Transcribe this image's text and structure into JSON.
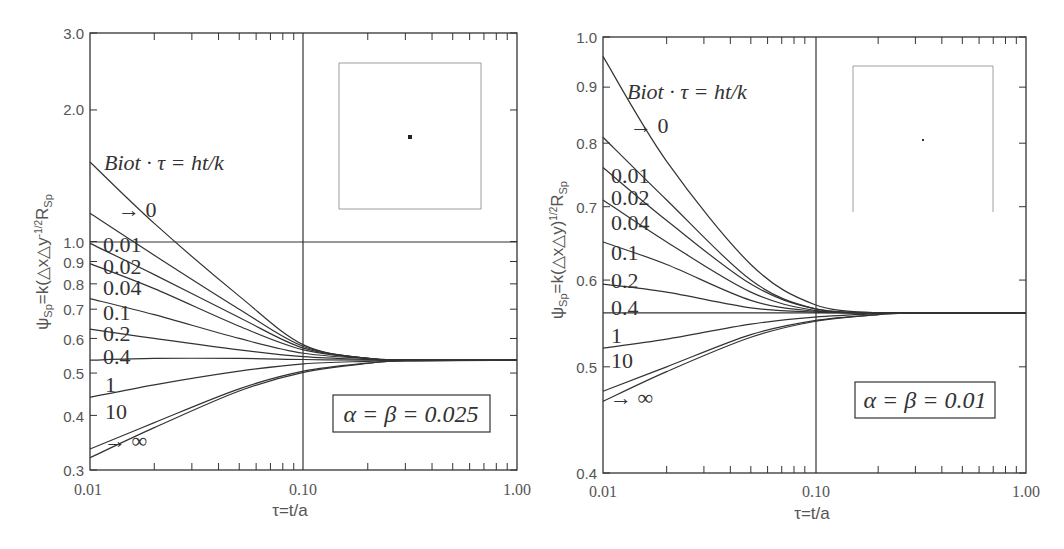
{
  "chart_data": [
    {
      "type": "line",
      "panel": "left",
      "title": "",
      "xlabel": "τ=t/a",
      "ylabel": "ψSp=k(△x△y)^-1/2 RSp",
      "xscale": "log",
      "yscale": "log",
      "xlim": [
        0.01,
        1.0
      ],
      "ylim": [
        0.3,
        3.0
      ],
      "x_ticks": [
        "0.01",
        "0.10",
        "1.00"
      ],
      "y_ticks": [
        "0.3",
        "0.4",
        "0.5",
        "0.6",
        "0.7",
        "0.8",
        "0.9",
        "1.0",
        "2.0",
        "3.0"
      ],
      "annotation": "Biot·τ = ht/k",
      "box_label": "α = β = 0.025",
      "grid": false,
      "reference_lines": {
        "x": 0.1,
        "y": 1.0
      },
      "x": [
        0.01,
        0.02,
        0.05,
        0.1,
        0.2,
        0.3,
        1.0
      ],
      "series": [
        {
          "name": "→ 0",
          "values": [
            1.52,
            1.1,
            0.75,
            0.58,
            0.54,
            0.535,
            0.535
          ]
        },
        {
          "name": "0.01",
          "values": [
            1.16,
            0.93,
            0.7,
            0.575,
            0.54,
            0.535,
            0.535
          ]
        },
        {
          "name": "0.02",
          "values": [
            0.99,
            0.84,
            0.67,
            0.57,
            0.54,
            0.535,
            0.535
          ]
        },
        {
          "name": "0.04",
          "values": [
            0.89,
            0.78,
            0.64,
            0.565,
            0.54,
            0.535,
            0.535
          ]
        },
        {
          "name": "0.1",
          "values": [
            0.74,
            0.68,
            0.6,
            0.555,
            0.54,
            0.535,
            0.535
          ]
        },
        {
          "name": "0.2",
          "values": [
            0.63,
            0.6,
            0.565,
            0.545,
            0.537,
            0.535,
            0.535
          ]
        },
        {
          "name": "0.4",
          "values": [
            0.535,
            0.54,
            0.54,
            0.537,
            0.535,
            0.535,
            0.535
          ]
        },
        {
          "name": "1",
          "values": [
            0.44,
            0.47,
            0.505,
            0.525,
            0.532,
            0.535,
            0.535
          ]
        },
        {
          "name": "10",
          "values": [
            0.335,
            0.385,
            0.46,
            0.505,
            0.527,
            0.533,
            0.535
          ]
        },
        {
          "name": "→ ∞",
          "values": [
            0.32,
            0.375,
            0.455,
            0.502,
            0.526,
            0.533,
            0.535
          ]
        }
      ]
    },
    {
      "type": "line",
      "panel": "right",
      "title": "",
      "xlabel": "τ=t/a",
      "ylabel": "ψSp=k(△x△y)^-1/2 RSp",
      "xscale": "log",
      "yscale": "log",
      "xlim": [
        0.01,
        1.0
      ],
      "ylim": [
        0.4,
        1.0
      ],
      "x_ticks": [
        "0.01",
        "0.10",
        "1.00"
      ],
      "y_ticks": [
        "0.4",
        "0.5",
        "0.6",
        "0.7",
        "0.8",
        "0.9",
        "1.0"
      ],
      "annotation": "Biot·τ = ht/k",
      "box_label": "α = β = 0.01",
      "grid": false,
      "reference_lines": {
        "x": 0.1
      },
      "x": [
        0.01,
        0.02,
        0.05,
        0.1,
        0.2,
        0.3,
        1.0
      ],
      "series": [
        {
          "name": "→ 0",
          "values": [
            0.96,
            0.77,
            0.62,
            0.57,
            0.56,
            0.56,
            0.56
          ]
        },
        {
          "name": "0.01",
          "values": [
            0.81,
            0.71,
            0.6,
            0.565,
            0.56,
            0.56,
            0.56
          ]
        },
        {
          "name": "0.02",
          "values": [
            0.76,
            0.68,
            0.595,
            0.565,
            0.56,
            0.56,
            0.56
          ]
        },
        {
          "name": "0.04",
          "values": [
            0.71,
            0.65,
            0.585,
            0.563,
            0.56,
            0.56,
            0.56
          ]
        },
        {
          "name": "0.1",
          "values": [
            0.65,
            0.62,
            0.575,
            0.562,
            0.56,
            0.56,
            0.56
          ]
        },
        {
          "name": "0.2",
          "values": [
            0.595,
            0.585,
            0.566,
            0.561,
            0.56,
            0.56,
            0.56
          ]
        },
        {
          "name": "0.4",
          "values": [
            0.56,
            0.56,
            0.56,
            0.56,
            0.56,
            0.56,
            0.56
          ]
        },
        {
          "name": "1",
          "values": [
            0.52,
            0.53,
            0.547,
            0.555,
            0.559,
            0.56,
            0.56
          ]
        },
        {
          "name": "10",
          "values": [
            0.475,
            0.5,
            0.535,
            0.551,
            0.558,
            0.56,
            0.56
          ]
        },
        {
          "name": "→ ∞",
          "values": [
            0.465,
            0.495,
            0.532,
            0.55,
            0.558,
            0.56,
            0.56
          ]
        }
      ]
    }
  ],
  "labels": {
    "left": {
      "annotation": "Biot · τ = ht/k",
      "box": "α = β = 0.025",
      "xlabel": "τ=t/a",
      "ylabel_main": "ψ",
      "ylabel_sub": "Sp",
      "ylabel_mid": "=k(△x△y",
      "ylabel_sup": "-1/2",
      "ylabel_R": "R",
      "ylabel_Rsub": "Sp",
      "x_ticks": [
        "0.01",
        "0.10",
        "1.00"
      ],
      "y_ticks": [
        "3.0",
        "2.0",
        "1.0",
        "0.9",
        "0.8",
        "0.7",
        "0.6",
        "0.5",
        "0.4",
        "0.3"
      ],
      "curve_labels": [
        "→ 0",
        "0.01",
        "0.02",
        "0.04",
        "0.1",
        "0.2",
        "0.4",
        "1",
        "10",
        "→ ∞"
      ]
    },
    "right": {
      "annotation": "Biot · τ = ht/k",
      "box": "α = β = 0.01",
      "xlabel": "τ=t/a",
      "ylabel_main": "ψ",
      "ylabel_sub": "Sp",
      "ylabel_mid": "=k(△x△y)",
      "ylabel_sup": "1/2",
      "ylabel_R": "R",
      "ylabel_Rsub": "Sp",
      "x_ticks": [
        "0.01",
        "0.10",
        "1.00"
      ],
      "y_ticks": [
        "1.0",
        "0.9",
        "0.8",
        "0.7",
        "0.6",
        "0.5",
        "0.4"
      ],
      "curve_labels": [
        "→ 0",
        "0.01",
        "0.02",
        "0.04",
        "0.1",
        "0.2",
        "0.4",
        "1",
        "10",
        "→ ∞"
      ]
    }
  },
  "colors": {
    "line": "#333333",
    "text": "#555555",
    "inset": "#888888"
  }
}
